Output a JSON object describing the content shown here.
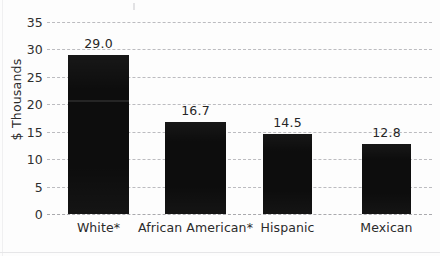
{
  "chart_data": {
    "type": "bar",
    "title": "",
    "subtitle": "",
    "xlabel": "",
    "ylabel": "$ Thousands",
    "categories": [
      "White*",
      "African American*",
      "Hispanic",
      "Mexican"
    ],
    "values": [
      29.0,
      16.7,
      14.5,
      12.8
    ],
    "value_labels": [
      "29.0",
      "16.7",
      "14.5",
      "12.8"
    ],
    "ylim": [
      0,
      35
    ],
    "ytick_values": [
      35,
      30,
      25,
      20,
      15,
      10,
      5,
      0
    ],
    "ytick_labels": [
      "35",
      "30",
      "25",
      "20",
      "15",
      "10",
      "5",
      "0"
    ],
    "grid": "horizontal-dashed",
    "legend": "none",
    "bar_color": "#0d0d0d",
    "grid_color": "#b9b9bd",
    "text_color": "#2b2b2b",
    "background_color": "#fdfdfd"
  }
}
